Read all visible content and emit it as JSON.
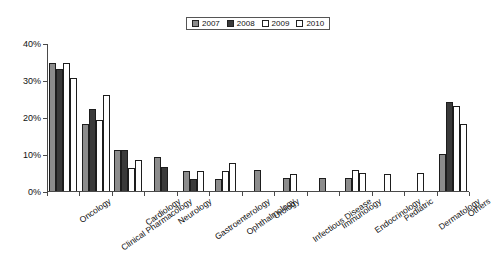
{
  "chart_data": {
    "type": "bar",
    "title": "",
    "subtitle": "",
    "xlabel": "",
    "ylabel": "",
    "ylim": [
      0,
      40
    ],
    "ytick_values": [
      0,
      10,
      20,
      30,
      40
    ],
    "ytick_labels": [
      "0%",
      "10%",
      "20%",
      "30%",
      "40%"
    ],
    "grid": false,
    "legend_position": "top-center",
    "categories": [
      "Oncology",
      "Clinical Pharmacology",
      "Cardiology",
      "Neurology",
      "Gastroenterology",
      "Ophthalmology",
      "Urology",
      "Infectious Disease",
      "Immunology",
      "Endocrinology",
      "Pediatric",
      "Dermatology",
      "Others"
    ],
    "series": [
      {
        "name": "2007",
        "color": "#8c8c8c",
        "values": [
          34.5,
          18.2,
          11.2,
          9.3,
          5.4,
          3.3,
          5.6,
          3.4,
          3.4,
          3.4,
          0,
          0,
          9.9
        ]
      },
      {
        "name": "2008",
        "color": "#3a3a3a",
        "values": [
          33.0,
          22.2,
          11.2,
          6.5,
          3.3,
          0,
          0,
          0,
          0,
          0,
          0,
          0,
          24.0
        ]
      },
      {
        "name": "2009",
        "color": "#ffffff",
        "values": [
          34.5,
          19.2,
          6.3,
          0,
          0,
          5.4,
          0,
          4.6,
          0,
          5.8,
          4.7,
          0,
          23.0
        ]
      },
      {
        "name": "2010",
        "color": "#ffffff",
        "values": [
          30.5,
          26.0,
          8.5,
          0,
          5.4,
          7.5,
          0,
          0,
          0,
          4.8,
          0,
          4.8,
          18.0
        ]
      }
    ]
  },
  "legend": {
    "entries": [
      {
        "label": "2007",
        "swatch": "gray-fill-swatch"
      },
      {
        "label": "2008",
        "swatch": "dark-fill-swatch"
      },
      {
        "label": "2009",
        "swatch": "white-fill-swatch"
      },
      {
        "label": "2010",
        "swatch": "white-fill-swatch"
      }
    ]
  }
}
